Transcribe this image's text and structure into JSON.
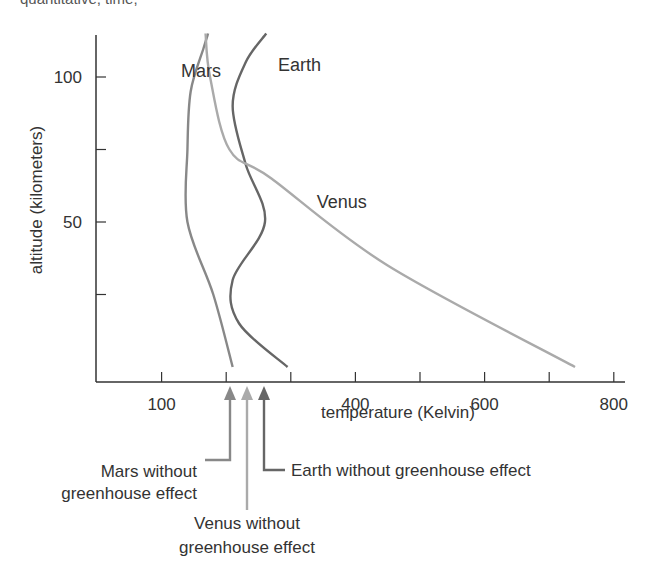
{
  "header_fragment": "quantitative, time,",
  "chart_data": {
    "type": "line",
    "title": "",
    "xlabel": "temperature (Kelvin)",
    "ylabel": "altitude (kilometers)",
    "xlim": [
      0,
      830
    ],
    "ylim": [
      -5,
      115
    ],
    "x_ticks": [
      100,
      200,
      300,
      400,
      500,
      600,
      700,
      800
    ],
    "x_tick_labels": [
      "100",
      "400",
      "600",
      "800"
    ],
    "x_tick_label_values": [
      100,
      400,
      600,
      800
    ],
    "y_ticks": [
      25,
      50,
      75,
      100
    ],
    "y_tick_labels": [
      "50",
      "100"
    ],
    "y_tick_label_values": [
      50,
      100
    ],
    "grid": false,
    "series": [
      {
        "name": "Mars",
        "color": "#888888",
        "points": [
          [
            210,
            0
          ],
          [
            180,
            25
          ],
          [
            140,
            50
          ],
          [
            140,
            75
          ],
          [
            145,
            95
          ],
          [
            165,
            110
          ],
          [
            172,
            115
          ]
        ]
      },
      {
        "name": "Earth",
        "color": "#666666",
        "points": [
          [
            295,
            0
          ],
          [
            220,
            15
          ],
          [
            210,
            30
          ],
          [
            260,
            50
          ],
          [
            230,
            70
          ],
          [
            210,
            90
          ],
          [
            230,
            105
          ],
          [
            262,
            115
          ]
        ]
      },
      {
        "name": "Venus",
        "color": "#aaaaaa",
        "points": [
          [
            740,
            0
          ],
          [
            450,
            35
          ],
          [
            270,
            65
          ],
          [
            205,
            75
          ],
          [
            175,
            100
          ],
          [
            168,
            115
          ]
        ]
      }
    ],
    "annotations": [
      {
        "text": "Mars",
        "x": 130,
        "y": 100
      },
      {
        "text": "Earth",
        "x": 280,
        "y": 102
      },
      {
        "text": "Venus",
        "x": 340,
        "y": 55
      }
    ],
    "reference_arrows": [
      {
        "label_line1": "Mars without",
        "label_line2": "greenhouse effect",
        "temperature": 210,
        "color": "#888888"
      },
      {
        "label_line1": "Venus without",
        "label_line2": "greenhouse effect",
        "temperature": 230,
        "color": "#aaaaaa"
      },
      {
        "label_line1": "Earth without greenhouse effect",
        "label_line2": "",
        "temperature": 255,
        "color": "#666666"
      }
    ]
  }
}
